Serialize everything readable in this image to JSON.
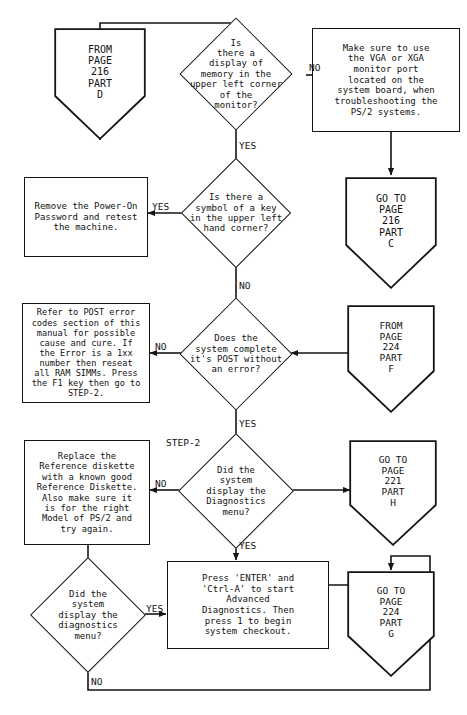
{
  "document": {
    "title": "PS/2 Troubleshooting Flowchart",
    "type": "flowchart",
    "ink_color": "#141414",
    "background_color": "#ffffff"
  },
  "nodes": {
    "from_216_d": {
      "shape": "connector",
      "lines": [
        "FROM",
        "PAGE",
        "216",
        "PART",
        "D"
      ],
      "text": "FROM\nPAGE\n216\nPART\nD"
    },
    "q_memory_display": {
      "shape": "decision",
      "text": "Is\nthere a\ndisplay of\nmemory in the\nupper left corner\nof the\nmonitor?"
    },
    "vga_note": {
      "shape": "process",
      "text": "Make sure to use\nthe VGA or XGA\nmonitor port\nlocated on the\nsystem board, when\ntroubleshooting the\nPS/2 systems."
    },
    "goto_216_c": {
      "shape": "connector",
      "text": "GO TO\nPAGE\n216\nPART\nC"
    },
    "q_key_symbol": {
      "shape": "decision",
      "text": "Is there a\nsymbol of a key\nin the upper left\nhand corner?"
    },
    "remove_password": {
      "shape": "process",
      "text": "Remove the Power-On\nPassword and retest\nthe machine."
    },
    "q_post_complete": {
      "shape": "decision",
      "text": "Does the\nsystem complete\nit's POST without\nan error?"
    },
    "post_error_codes": {
      "shape": "process",
      "text": "Refer to POST error\ncodes section of this\nmanual for possible\ncause and cure. If\nthe Error is a 1xx\nnumber then reseat\nall RAM SIMMs. Press\nthe F1 key then go to\nSTEP-2."
    },
    "from_224_f": {
      "shape": "connector",
      "text": "FROM\nPAGE\n224\nPART\nF"
    },
    "q_diagnostics_menu_upper": {
      "shape": "decision",
      "text": "Did the\nsystem\ndisplay the\nDiagnostics\nmenu?"
    },
    "replace_diskette": {
      "shape": "process",
      "text": "Replace the\nReference diskette\nwith a known good\nReference Diskette.\nAlso make sure it\nis for the right\nModel of PS/2 and\ntry again."
    },
    "goto_221_h": {
      "shape": "connector",
      "text": "GO TO\nPAGE\n221\nPART\nH"
    },
    "q_diagnostics_menu_lower": {
      "shape": "decision",
      "text": "Did the\nsystem\ndisplay the\ndiagnostics\nmenu?"
    },
    "press_enter": {
      "shape": "process",
      "text": "Press 'ENTER' and\n'Ctrl-A' to start\nAdvanced\nDiagnostics. Then\npress 1 to begin\nsystem checkout."
    },
    "goto_224_g": {
      "shape": "connector",
      "text": "GO TO\nPAGE\n224\nPART\nG"
    }
  },
  "edge_labels": {
    "memory_no": "NO",
    "memory_yes": "YES",
    "key_yes": "YES",
    "key_no": "NO",
    "post_no": "NO",
    "post_yes": "YES",
    "diag_upper_no": "NO",
    "diag_upper_yes": "YES",
    "diag_lower_yes": "YES",
    "diag_lower_no": "NO"
  },
  "annotations": {
    "step2": "STEP-2"
  }
}
